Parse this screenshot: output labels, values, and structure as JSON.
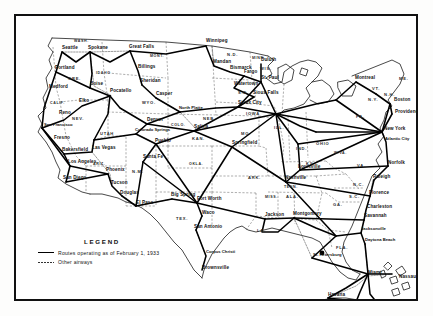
{
  "document": {
    "type": "map",
    "title": "Air Transport Routes of the United States",
    "frame_color": "#111111"
  },
  "legend": {
    "title": "LEGEND",
    "entries": [
      {
        "style": "solid",
        "label": "Routes operating as of February 1, 1933"
      },
      {
        "style": "dashed",
        "label": "Other airways"
      }
    ]
  },
  "map": {
    "cities": [
      {
        "name": "Seattle",
        "x": 46,
        "y": 33
      },
      {
        "name": "Spokane",
        "x": 72,
        "y": 33
      },
      {
        "name": "Portland",
        "x": 39,
        "y": 53
      },
      {
        "name": "Medford",
        "x": 33,
        "y": 72
      },
      {
        "name": "Boise",
        "x": 74,
        "y": 69
      },
      {
        "name": "Great Falls",
        "x": 113,
        "y": 32
      },
      {
        "name": "Billings",
        "x": 122,
        "y": 52
      },
      {
        "name": "Sheridan",
        "x": 124,
        "y": 66
      },
      {
        "name": "Pocatello",
        "x": 94,
        "y": 76
      },
      {
        "name": "Casper",
        "x": 140,
        "y": 79
      },
      {
        "name": "Winnipeg",
        "x": 190,
        "y": 26
      },
      {
        "name": "Mandan",
        "x": 197,
        "y": 47
      },
      {
        "name": "Bismarck",
        "x": 214,
        "y": 53
      },
      {
        "name": "Fargo",
        "x": 228,
        "y": 57
      },
      {
        "name": "Duluth",
        "x": 245,
        "y": 45
      },
      {
        "name": "Watertown",
        "x": 218,
        "y": 69
      },
      {
        "name": "Sioux Falls",
        "x": 237,
        "y": 78
      },
      {
        "name": "St. Paul",
        "x": 245,
        "y": 63
      },
      {
        "name": "North Platte",
        "x": 163,
        "y": 93
      },
      {
        "name": "Sioux City",
        "x": 222,
        "y": 88
      },
      {
        "name": "Elko",
        "x": 63,
        "y": 86
      },
      {
        "name": "Reno",
        "x": 43,
        "y": 98
      },
      {
        "name": "San Francisco",
        "x": 28,
        "y": 110
      },
      {
        "name": "Fresno",
        "x": 38,
        "y": 123
      },
      {
        "name": "Bakersfield",
        "x": 46,
        "y": 135
      },
      {
        "name": "Las Vegas",
        "x": 76,
        "y": 133
      },
      {
        "name": "Los Angeles",
        "x": 52,
        "y": 147
      },
      {
        "name": "San Diego",
        "x": 47,
        "y": 163
      },
      {
        "name": "Phoenix",
        "x": 90,
        "y": 155
      },
      {
        "name": "Tucson",
        "x": 95,
        "y": 168
      },
      {
        "name": "Douglas",
        "x": 104,
        "y": 178
      },
      {
        "name": "Denver",
        "x": 131,
        "y": 105
      },
      {
        "name": "Colorado Springs",
        "x": 119,
        "y": 115
      },
      {
        "name": "Pueblo",
        "x": 139,
        "y": 126
      },
      {
        "name": "Santa Fe",
        "x": 127,
        "y": 142
      },
      {
        "name": "Salina",
        "x": 178,
        "y": 112
      },
      {
        "name": "Springfield",
        "x": 216,
        "y": 128
      },
      {
        "name": "El Paso",
        "x": 120,
        "y": 188
      },
      {
        "name": "Big Spring",
        "x": 155,
        "y": 180
      },
      {
        "name": "Fort Worth",
        "x": 181,
        "y": 184
      },
      {
        "name": "Waco",
        "x": 186,
        "y": 198
      },
      {
        "name": "San Antonio",
        "x": 178,
        "y": 212
      },
      {
        "name": "Corpus Christi",
        "x": 190,
        "y": 237
      },
      {
        "name": "Brownsville",
        "x": 186,
        "y": 253
      },
      {
        "name": "Jackson",
        "x": 249,
        "y": 200
      },
      {
        "name": "Montgomery",
        "x": 277,
        "y": 199
      },
      {
        "name": "Nashville",
        "x": 269,
        "y": 163
      },
      {
        "name": "Louisville",
        "x": 282,
        "y": 152
      },
      {
        "name": "Montreal",
        "x": 339,
        "y": 63
      },
      {
        "name": "Boston",
        "x": 378,
        "y": 85
      },
      {
        "name": "Providence",
        "x": 379,
        "y": 97
      },
      {
        "name": "New York",
        "x": 368,
        "y": 114
      },
      {
        "name": "Atlantic City",
        "x": 369,
        "y": 124
      },
      {
        "name": "Norfolk",
        "x": 372,
        "y": 148
      },
      {
        "name": "Raleigh",
        "x": 357,
        "y": 162
      },
      {
        "name": "Florence",
        "x": 353,
        "y": 178
      },
      {
        "name": "Charleston",
        "x": 351,
        "y": 192
      },
      {
        "name": "Savannah",
        "x": 348,
        "y": 201
      },
      {
        "name": "Jacksonville",
        "x": 345,
        "y": 214
      },
      {
        "name": "Daytona Beach",
        "x": 349,
        "y": 225
      },
      {
        "name": "St. Petersburg",
        "x": 297,
        "y": 240
      },
      {
        "name": "Miami",
        "x": 352,
        "y": 258
      },
      {
        "name": "Nassau",
        "x": 383,
        "y": 262
      },
      {
        "name": "Havana",
        "x": 312,
        "y": 280
      }
    ],
    "states": [
      {
        "abbr": "WASH.",
        "x": 58,
        "y": 26
      },
      {
        "abbr": "ORE.",
        "x": 52,
        "y": 64
      },
      {
        "abbr": "IDAHO",
        "x": 80,
        "y": 58
      },
      {
        "abbr": "MONT.",
        "x": 134,
        "y": 41
      },
      {
        "abbr": "N.D.",
        "x": 211,
        "y": 40
      },
      {
        "abbr": "MINN.",
        "x": 236,
        "y": 43
      },
      {
        "abbr": "S.D.",
        "x": 222,
        "y": 78
      },
      {
        "abbr": "WYO.",
        "x": 126,
        "y": 88
      },
      {
        "abbr": "NEV.",
        "x": 56,
        "y": 104
      },
      {
        "abbr": "CALIF.",
        "x": 34,
        "y": 88
      },
      {
        "abbr": "UTAH",
        "x": 84,
        "y": 119
      },
      {
        "abbr": "COLO.",
        "x": 155,
        "y": 110
      },
      {
        "abbr": "NEB.",
        "x": 187,
        "y": 104
      },
      {
        "abbr": "IOWA",
        "x": 230,
        "y": 99
      },
      {
        "abbr": "WIS.",
        "x": 244,
        "y": 54
      },
      {
        "abbr": "ILL.",
        "x": 258,
        "y": 113
      },
      {
        "abbr": "IND.",
        "x": 280,
        "y": 134
      },
      {
        "abbr": "OHIO",
        "x": 300,
        "y": 129
      },
      {
        "abbr": "PA.",
        "x": 340,
        "y": 102
      },
      {
        "abbr": "N.Y.",
        "x": 352,
        "y": 85
      },
      {
        "abbr": "VT.",
        "x": 356,
        "y": 74
      },
      {
        "abbr": "N.H.",
        "x": 368,
        "y": 80
      },
      {
        "abbr": "ME.",
        "x": 383,
        "y": 64
      },
      {
        "abbr": "W.VA.",
        "x": 318,
        "y": 138
      },
      {
        "abbr": "VA.",
        "x": 341,
        "y": 151
      },
      {
        "abbr": "KY.",
        "x": 290,
        "y": 149
      },
      {
        "abbr": "MO.",
        "x": 225,
        "y": 119
      },
      {
        "abbr": "KAN.",
        "x": 176,
        "y": 124
      },
      {
        "abbr": "OKLA.",
        "x": 173,
        "y": 149
      },
      {
        "abbr": "ARIZ.",
        "x": 77,
        "y": 149
      },
      {
        "abbr": "N.M.",
        "x": 116,
        "y": 157
      },
      {
        "abbr": "TEX.",
        "x": 160,
        "y": 204
      },
      {
        "abbr": "ARK.",
        "x": 232,
        "y": 163
      },
      {
        "abbr": "MISS.",
        "x": 249,
        "y": 182
      },
      {
        "abbr": "LA.",
        "x": 241,
        "y": 216
      },
      {
        "abbr": "TENN.",
        "x": 268,
        "y": 172
      },
      {
        "abbr": "ALA.",
        "x": 270,
        "y": 182
      },
      {
        "abbr": "GA.",
        "x": 317,
        "y": 190
      },
      {
        "abbr": "N.C.",
        "x": 337,
        "y": 170
      },
      {
        "abbr": "S.C.",
        "x": 333,
        "y": 182
      },
      {
        "abbr": "FLA.",
        "x": 320,
        "y": 233
      }
    ]
  }
}
